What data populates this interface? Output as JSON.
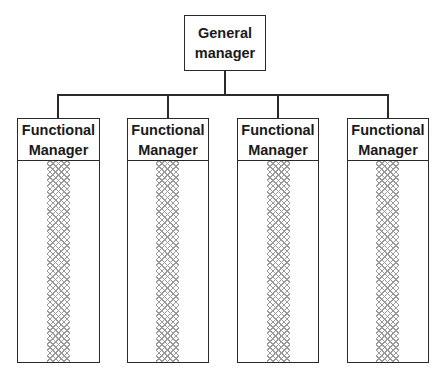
{
  "chart": {
    "top": {
      "label_line1": "General",
      "label_line2": "manager"
    },
    "units": [
      {
        "label_line1": "Functional",
        "label_line2": "Manager"
      },
      {
        "label_line1": "Functional",
        "label_line2": "Manager"
      },
      {
        "label_line1": "Functional",
        "label_line2": "Manager"
      },
      {
        "label_line1": "Functional",
        "label_line2": "Manager"
      }
    ]
  },
  "colors": {
    "line": "#2a2a2a",
    "hatch": "#9a9a9a"
  }
}
